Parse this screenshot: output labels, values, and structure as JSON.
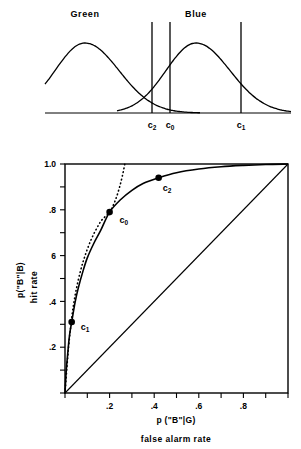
{
  "figure": {
    "title": "",
    "panels": [
      "signal-detection-distributions",
      "roc-curve"
    ]
  },
  "top_panel": {
    "distribution_labels": [
      {
        "name": "Green",
        "x": 85
      },
      {
        "name": "Blue",
        "x": 196
      }
    ],
    "criteria": [
      {
        "name": "c",
        "subscript": "2",
        "x": 152
      },
      {
        "name": "c",
        "subscript": "0",
        "x": 170
      },
      {
        "name": "c",
        "subscript": "1",
        "x": 241
      }
    ],
    "baseline_y": 113
  },
  "chart_data": {
    "type": "line",
    "title": "",
    "xlabel": "p (\"B\"|G)",
    "xlabel_sub": "false alarm rate",
    "ylabel": "p(\"B\"|B)",
    "ylabel_sub": "hit rate",
    "xlim": [
      0,
      1
    ],
    "ylim": [
      0,
      1
    ],
    "xticks": [
      0,
      0.1,
      0.2,
      0.3,
      0.4,
      0.5,
      0.6,
      0.7,
      0.8,
      0.9,
      1.0
    ],
    "yticks": [
      0,
      0.1,
      0.2,
      0.3,
      0.4,
      0.5,
      0.6,
      0.7,
      0.8,
      0.9,
      1.0
    ],
    "xtick_labels": [
      {
        "value": 0.2,
        "label": ".2"
      },
      {
        "value": 0.4,
        "label": ".4"
      },
      {
        "value": 0.6,
        "label": ".6"
      },
      {
        "value": 0.8,
        "label": ".8"
      }
    ],
    "ytick_labels": [
      {
        "value": 0.2,
        "label": ".2"
      },
      {
        "value": 0.4,
        "label": ".4"
      },
      {
        "value": 0.6,
        "label": "6"
      },
      {
        "value": 0.8,
        "label": ".8"
      },
      {
        "value": 1.0,
        "label": "1.0"
      }
    ],
    "grid": false,
    "legend": "none",
    "series": [
      {
        "name": "roc-curve",
        "style": "solid",
        "points": [
          [
            0.0,
            0.0
          ],
          [
            0.005,
            0.09
          ],
          [
            0.012,
            0.17
          ],
          [
            0.02,
            0.25
          ],
          [
            0.03,
            0.31
          ],
          [
            0.045,
            0.395
          ],
          [
            0.06,
            0.46
          ],
          [
            0.08,
            0.53
          ],
          [
            0.1,
            0.59
          ],
          [
            0.13,
            0.655
          ],
          [
            0.16,
            0.71
          ],
          [
            0.2,
            0.79
          ],
          [
            0.25,
            0.845
          ],
          [
            0.3,
            0.885
          ],
          [
            0.35,
            0.915
          ],
          [
            0.42,
            0.94
          ],
          [
            0.5,
            0.962
          ],
          [
            0.6,
            0.978
          ],
          [
            0.7,
            0.988
          ],
          [
            0.8,
            0.994
          ],
          [
            0.9,
            0.998
          ],
          [
            1.0,
            1.0
          ]
        ]
      },
      {
        "name": "iso-bias-dotted",
        "style": "dotted",
        "points": [
          [
            0.0,
            0.0
          ],
          [
            0.008,
            0.105
          ],
          [
            0.016,
            0.2
          ],
          [
            0.025,
            0.285
          ],
          [
            0.035,
            0.365
          ],
          [
            0.05,
            0.45
          ],
          [
            0.07,
            0.535
          ],
          [
            0.09,
            0.6
          ],
          [
            0.115,
            0.665
          ],
          [
            0.14,
            0.715
          ],
          [
            0.165,
            0.755
          ],
          [
            0.2,
            0.79
          ],
          [
            0.225,
            0.84
          ],
          [
            0.245,
            0.9
          ],
          [
            0.26,
            0.96
          ],
          [
            0.268,
            1.0
          ]
        ]
      },
      {
        "name": "chance-diagonal",
        "style": "solid",
        "points": [
          [
            0.0,
            0.0
          ],
          [
            1.0,
            1.0
          ]
        ]
      }
    ],
    "marked_points": [
      {
        "label": "c",
        "subscript": "1",
        "x": 0.03,
        "y": 0.31,
        "label_dx": 9,
        "label_dy": 8
      },
      {
        "label": "c",
        "subscript": "0",
        "x": 0.2,
        "y": 0.79,
        "label_dx": 10,
        "label_dy": 11
      },
      {
        "label": "c",
        "subscript": "2",
        "x": 0.42,
        "y": 0.94,
        "label_dx": 4,
        "label_dy": 13
      }
    ]
  },
  "colors": {
    "ink": "#000000",
    "background": "#ffffff"
  }
}
